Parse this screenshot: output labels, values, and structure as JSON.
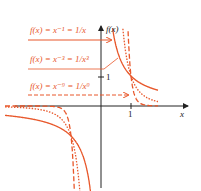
{
  "colors": {
    "curve": "#e8572a",
    "axis": "#222222",
    "background": "#ffffff"
  },
  "axes": {
    "x_label": "x",
    "y_label": "f(x)",
    "x_tick": "1",
    "y_tick": "1",
    "origin_px": [
      101,
      106
    ],
    "unit_px": 30
  },
  "labels": [
    {
      "text": "f(x) = x⁻¹ = 1/x",
      "style": "solid"
    },
    {
      "text": "f(x) = x⁻³ = 1/x³",
      "style": "dotted"
    },
    {
      "text": "f(x) = x⁻⁹ = 1/x⁹",
      "style": "dashed"
    }
  ],
  "chart_data": {
    "type": "line",
    "title": "",
    "xlabel": "x",
    "ylabel": "f(x)",
    "xlim": [
      -3.2,
      1.9
    ],
    "ylim": [
      -2.8,
      2.3
    ],
    "grid": false,
    "series": [
      {
        "name": "f(x) = x^-1 = 1/x",
        "style": "solid",
        "exponent": -1
      },
      {
        "name": "f(x) = x^-3 = 1/x^3",
        "style": "dotted",
        "exponent": -3
      },
      {
        "name": "f(x) = x^-9 = 1/x^9",
        "style": "dashed",
        "exponent": -9
      }
    ],
    "annotations": [
      "tick x=1",
      "tick y=1"
    ]
  }
}
